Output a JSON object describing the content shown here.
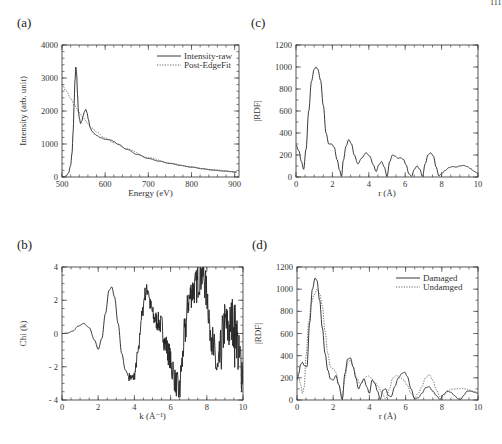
{
  "page_number_fragment": "111",
  "chart_data": [
    {
      "id": "a",
      "panel_label": "(a)",
      "type": "line",
      "box": {
        "left": 62,
        "top": 45,
        "right": 239,
        "bottom": 177
      },
      "xlabel": "Energy (eV)",
      "ylabel": "Intensity (arb. unit)",
      "xlim": [
        500,
        910
      ],
      "ylim": [
        0,
        4000
      ],
      "xticks": [
        500,
        600,
        700,
        800,
        900
      ],
      "yticks": [
        0,
        1000,
        2000,
        3000,
        4000
      ],
      "x_minor": 20,
      "y_minor": 200,
      "legend": {
        "position": "upper right",
        "entries": [
          "Intensity-raw",
          "Post-EdgeFit"
        ]
      },
      "series": [
        {
          "name": "Intensity-raw",
          "style": "solid",
          "x": [
            500,
            505,
            510,
            515,
            520,
            523,
            526,
            528,
            530,
            532,
            534,
            536,
            538,
            540,
            543,
            546,
            549,
            552,
            555,
            558,
            561,
            565,
            570,
            575,
            580,
            590,
            600,
            610,
            615,
            620,
            630,
            650,
            675,
            700,
            725,
            750,
            775,
            800,
            825,
            850,
            875,
            905
          ],
          "y": [
            0,
            10,
            40,
            120,
            350,
            700,
            1400,
            2200,
            2900,
            3330,
            3100,
            2500,
            2000,
            1800,
            1620,
            1700,
            1850,
            1980,
            2050,
            1950,
            1750,
            1500,
            1380,
            1310,
            1260,
            1190,
            1140,
            1130,
            1110,
            1070,
            990,
            840,
            680,
            560,
            480,
            410,
            350,
            300,
            250,
            210,
            180,
            150
          ]
        },
        {
          "name": "Post-EdgeFit",
          "style": "dotted",
          "x": [
            500,
            510,
            520,
            530,
            540,
            550,
            560,
            570,
            580,
            600,
            620,
            650,
            700,
            750,
            800,
            850,
            905
          ],
          "y": [
            2800,
            2600,
            2380,
            2150,
            1950,
            1780,
            1620,
            1480,
            1360,
            1180,
            1040,
            850,
            590,
            420,
            300,
            215,
            150
          ]
        }
      ]
    },
    {
      "id": "b",
      "panel_label": "(b)",
      "type": "line",
      "box": {
        "left": 62,
        "top": 267,
        "right": 243,
        "bottom": 400
      },
      "xlabel": "k (Å⁻¹)",
      "ylabel": "Chi (k)",
      "xlim": [
        0,
        10
      ],
      "ylim": [
        -4,
        4
      ],
      "xticks": [
        0,
        2,
        4,
        6,
        8,
        10
      ],
      "yticks": [
        -4,
        -2,
        0,
        2,
        4
      ],
      "x_minor": 0.5,
      "y_minor": 0.5,
      "series": [
        {
          "name": "Chi(k)",
          "style": "solid",
          "x": [
            0,
            0.3,
            0.6,
            0.9,
            1.2,
            1.5,
            1.8,
            2.0,
            2.2,
            2.4,
            2.6,
            2.75,
            2.9,
            3.1,
            3.3,
            3.5,
            3.7,
            3.9,
            4.0,
            4.2,
            4.4,
            4.6,
            4.75,
            4.9,
            5.1,
            5.3,
            5.5,
            5.7,
            5.9,
            6.1,
            6.3,
            6.5,
            6.6,
            6.8,
            7.0,
            7.2,
            7.4,
            7.6,
            7.8,
            8.0,
            8.2,
            8.4,
            8.6,
            8.8,
            9.0,
            9.2,
            9.4,
            9.6,
            9.8,
            10.0
          ],
          "y": [
            0,
            0.02,
            0.15,
            0.45,
            0.6,
            0.35,
            -0.4,
            -0.95,
            -0.3,
            1.2,
            2.6,
            2.8,
            2.2,
            0.6,
            -1.2,
            -2.2,
            -2.6,
            -2.7,
            -2.5,
            -1.2,
            1.0,
            2.4,
            2.7,
            1.6,
            0.9,
            0.7,
            0.5,
            -0.6,
            -1.2,
            -2.3,
            -3.0,
            -3.5,
            -2.0,
            0.2,
            2.0,
            2.6,
            2.8,
            3.4,
            3.6,
            2.4,
            0.4,
            -1.2,
            -2.4,
            -1.0,
            0.6,
            0.2,
            0.8,
            0.3,
            -1.6,
            -2.2
          ],
          "noise_from_k": 3.7
        }
      ]
    },
    {
      "id": "c",
      "panel_label": "(c)",
      "type": "line",
      "box": {
        "left": 296,
        "top": 45,
        "right": 478,
        "bottom": 177
      },
      "xlabel": "r (Å)",
      "ylabel": "|RDF|",
      "xlim": [
        0,
        10
      ],
      "ylim": [
        0,
        1200
      ],
      "xticks": [
        0,
        2,
        4,
        6,
        8,
        10
      ],
      "yticks": [
        0,
        200,
        400,
        600,
        800,
        1000,
        1200
      ],
      "x_minor": 0.5,
      "y_minor": 100,
      "series": [
        {
          "name": "|RDF|",
          "style": "solid",
          "x": [
            0,
            0.15,
            0.3,
            0.42,
            0.55,
            0.7,
            0.85,
            1.0,
            1.1,
            1.2,
            1.35,
            1.5,
            1.65,
            1.8,
            1.95,
            2.1,
            2.25,
            2.4,
            2.5,
            2.6,
            2.75,
            2.9,
            3.05,
            3.2,
            3.4,
            3.6,
            3.85,
            4.05,
            4.25,
            4.4,
            4.55,
            4.7,
            4.85,
            5.0,
            5.15,
            5.3,
            5.45,
            5.6,
            5.75,
            5.9,
            6.05,
            6.2,
            6.35,
            6.5,
            6.65,
            6.8,
            6.95,
            7.1,
            7.25,
            7.4,
            7.55,
            7.7,
            7.85,
            8.0,
            8.2,
            8.4,
            8.6,
            8.8,
            9.0,
            9.2,
            9.4,
            9.6,
            9.8,
            10.0
          ],
          "y": [
            290,
            240,
            140,
            70,
            250,
            600,
            870,
            980,
            1000,
            980,
            880,
            650,
            400,
            300,
            300,
            270,
            160,
            60,
            5,
            150,
            280,
            340,
            300,
            200,
            120,
            170,
            220,
            190,
            110,
            50,
            110,
            140,
            90,
            5,
            140,
            200,
            190,
            170,
            175,
            160,
            110,
            30,
            5,
            70,
            100,
            70,
            5,
            120,
            200,
            220,
            190,
            90,
            10,
            30,
            60,
            85,
            95,
            90,
            100,
            105,
            95,
            75,
            50,
            30
          ]
        }
      ]
    },
    {
      "id": "d",
      "panel_label": "(d)",
      "type": "line",
      "box": {
        "left": 297,
        "top": 267,
        "right": 478,
        "bottom": 400
      },
      "xlabel": "r (Å)",
      "ylabel": "|RDF|",
      "xlim": [
        0,
        10
      ],
      "ylim": [
        0,
        1200
      ],
      "xticks": [
        0,
        2,
        4,
        6,
        8,
        10
      ],
      "yticks": [
        0,
        200,
        400,
        600,
        800,
        1000,
        1200
      ],
      "x_minor": 0.5,
      "y_minor": 100,
      "legend": {
        "position": "upper right",
        "entries": [
          "Damaged",
          "Undamged"
        ]
      },
      "series": [
        {
          "name": "Damaged",
          "style": "solid",
          "x": [
            0,
            0.1,
            0.2,
            0.3,
            0.4,
            0.55,
            0.7,
            0.85,
            1.0,
            1.1,
            1.25,
            1.4,
            1.55,
            1.7,
            1.85,
            2.0,
            2.15,
            2.3,
            2.5,
            2.65,
            2.8,
            2.95,
            3.1,
            3.25,
            3.4,
            3.55,
            3.7,
            3.85,
            4.0,
            4.15,
            4.3,
            4.45,
            4.6,
            4.75,
            4.9,
            5.05,
            5.2,
            5.4,
            5.6,
            5.8,
            5.95,
            6.1,
            6.3,
            6.5,
            6.7,
            6.9,
            7.1,
            7.3,
            7.5,
            7.7,
            7.9,
            8.1,
            8.3,
            8.5,
            8.7,
            8.9,
            9.05,
            9.2,
            9.4,
            9.6,
            9.8,
            10.0
          ],
          "y": [
            180,
            240,
            320,
            340,
            310,
            300,
            700,
            1000,
            1100,
            1080,
            900,
            650,
            420,
            270,
            190,
            180,
            220,
            140,
            5,
            240,
            370,
            380,
            300,
            200,
            100,
            150,
            190,
            120,
            60,
            180,
            150,
            80,
            5,
            90,
            100,
            40,
            30,
            120,
            200,
            240,
            250,
            210,
            100,
            10,
            20,
            60,
            110,
            120,
            80,
            40,
            5,
            50,
            80,
            70,
            40,
            10,
            5,
            40,
            80,
            80,
            70,
            60
          ]
        },
        {
          "name": "Undamged",
          "style": "dotted",
          "x": [
            0,
            0.1,
            0.2,
            0.3,
            0.4,
            0.5,
            0.65,
            0.8,
            0.95,
            1.1,
            1.25,
            1.4,
            1.55,
            1.7,
            1.85,
            2.0,
            2.15,
            2.3,
            2.5,
            2.65,
            2.8,
            2.95,
            3.1,
            3.3,
            3.5,
            3.7,
            3.9,
            4.1,
            4.3,
            4.5,
            4.7,
            4.9,
            5.1,
            5.3,
            5.5,
            5.7,
            5.9,
            6.1,
            6.3,
            6.5,
            6.7,
            6.9,
            7.1,
            7.3,
            7.5,
            7.7,
            7.9,
            8.1,
            8.3,
            8.5,
            8.7,
            8.9,
            9.1,
            9.3,
            9.5,
            9.7,
            10.0
          ],
          "y": [
            250,
            200,
            140,
            60,
            120,
            400,
            700,
            880,
            950,
            1000,
            960,
            850,
            620,
            420,
            300,
            280,
            250,
            140,
            30,
            200,
            330,
            360,
            300,
            200,
            140,
            190,
            220,
            200,
            160,
            120,
            60,
            10,
            100,
            200,
            220,
            200,
            180,
            130,
            60,
            20,
            60,
            120,
            200,
            230,
            180,
            90,
            30,
            40,
            80,
            95,
            100,
            100,
            105,
            100,
            90,
            80,
            70
          ]
        }
      ]
    }
  ]
}
